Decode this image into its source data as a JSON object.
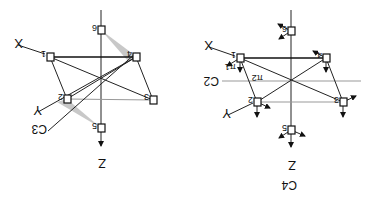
{
  "figure": {
    "orientation": "rotated-180",
    "left_panel": {
      "axes": {
        "x": "X",
        "y": "Y",
        "z": "Z"
      },
      "rotation_axis_label": "C3",
      "atoms": [
        {
          "id": "B1",
          "label": "1"
        },
        {
          "id": "B2",
          "label": "2"
        },
        {
          "id": "B3",
          "label": "3"
        },
        {
          "id": "B4",
          "label": "4"
        },
        {
          "id": "B5",
          "label": "5"
        },
        {
          "id": "B6",
          "label": "6"
        }
      ]
    },
    "right_panel": {
      "axes": {
        "x": "X",
        "y": "Y",
        "z": "Z"
      },
      "axis_labels": {
        "c4": "C4",
        "c2": "C2"
      },
      "mode_labels": {
        "pi1": "π1",
        "pi2": "π2"
      },
      "atoms": [
        {
          "id": "B1",
          "label": "1"
        },
        {
          "id": "B2",
          "label": "2"
        },
        {
          "id": "B3",
          "label": "3"
        },
        {
          "id": "B4",
          "label": "4"
        },
        {
          "id": "B5",
          "label": "5"
        },
        {
          "id": "B6",
          "label": "6"
        }
      ]
    }
  }
}
